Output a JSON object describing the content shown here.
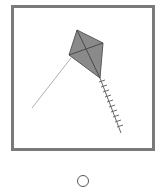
{
  "image_option": {
    "subject": "kite",
    "icon": "kite-icon",
    "frame_color": "#7a7a7a",
    "kite_fill": "#8a8a8a",
    "kite_lines": "#4a4a4a",
    "string_color": "#b0b0b0",
    "tail_color": "#6a6a6a",
    "selected": false
  },
  "radio": {
    "icon": "radio-button-icon",
    "state": "unchecked"
  }
}
